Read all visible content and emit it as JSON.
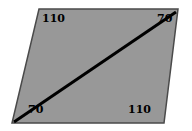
{
  "figure": {
    "shape": {
      "name": "parallelogram",
      "fill_color": "#989898",
      "stroke_color": "#4a4a4a",
      "stroke_width": 1.5,
      "vertices": [
        {
          "name": "top-left",
          "x": 39,
          "y": 9
        },
        {
          "name": "top-right",
          "x": 178,
          "y": 9
        },
        {
          "name": "bottom-right",
          "x": 164,
          "y": 123
        },
        {
          "name": "bottom-left",
          "x": 12,
          "y": 123
        }
      ]
    },
    "diagonal": {
      "name": "diagonal-line",
      "color": "#000000",
      "width": 3,
      "from": {
        "x": 14,
        "y": 122
      },
      "to": {
        "x": 176,
        "y": 12
      }
    },
    "labels": [
      {
        "id": "top-left",
        "value": "110"
      },
      {
        "id": "top-right",
        "value": "70"
      },
      {
        "id": "bottom-left",
        "value": "70"
      },
      {
        "id": "bottom-right",
        "value": "110"
      }
    ]
  }
}
